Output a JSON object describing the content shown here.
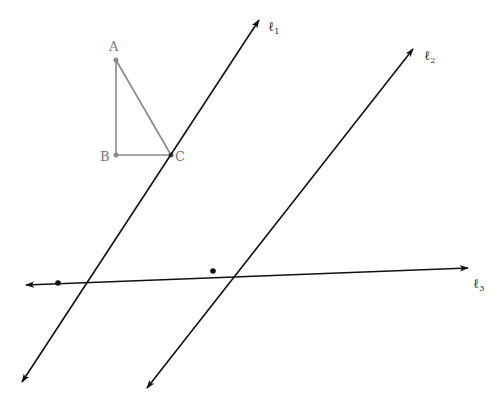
{
  "colors": {
    "line": "#111111",
    "triangle": "#888888",
    "label_triangle": "#777777",
    "label_line": "#222222"
  },
  "triangle": {
    "points": {
      "A": "A",
      "B": "B",
      "C": "C"
    }
  },
  "lines": {
    "l1": {
      "name": "ℓ",
      "sub": "1"
    },
    "l2": {
      "name": "ℓ",
      "sub": "2"
    },
    "l3": {
      "name": "ℓ",
      "sub": "3"
    }
  }
}
